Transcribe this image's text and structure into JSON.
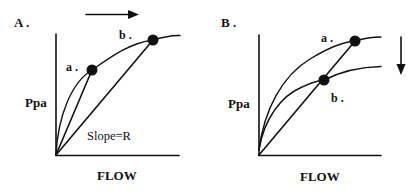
{
  "figure": {
    "colors": {
      "ink": "#111111",
      "background": "#ffffff"
    },
    "panels": [
      {
        "id": "A",
        "label": "A .",
        "y_axis_label": "Ppa",
        "x_axis_label": "FLOW",
        "annotation": "Slope=R",
        "point_labels": {
          "a": "a .",
          "b": "b ."
        },
        "arrow": {
          "direction": "right",
          "icon": "arrow-right-icon"
        },
        "description": "Single pressure-flow curve; operating point moves from a to b along curve as flow increases; chords from origin show slope R decreasing"
      },
      {
        "id": "B",
        "label": "B .",
        "y_axis_label": "Ppa",
        "x_axis_label": "FLOW",
        "point_labels": {
          "a": "a .",
          "b": "b ."
        },
        "arrow": {
          "direction": "down",
          "icon": "arrow-down-icon"
        },
        "description": "Two pressure-flow curves; curve shifts downward from a to b; points a and b lie on same chord from origin"
      }
    ]
  }
}
